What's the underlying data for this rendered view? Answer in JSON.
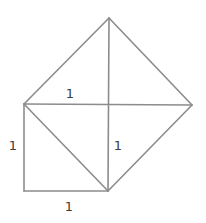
{
  "diagram": {
    "stroke_color": "#8c8c8c",
    "label_color": "#3c3c3c",
    "points": {
      "A": "bottom-left of small square",
      "B": "bottom-right of small square",
      "C": "top-left of small square",
      "T": "top vertex of large square",
      "R": "right vertex of large square",
      "M": "intersection / foot on vertical"
    },
    "labels": {
      "top": "1",
      "left": "1",
      "middle": "1",
      "bottom": "1"
    }
  }
}
